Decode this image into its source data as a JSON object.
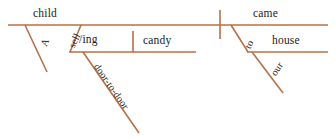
{
  "diagram": {
    "type": "reed-kellogg-sentence-diagram",
    "sentence": "A child selling candy door-to-door came to our house.",
    "line_color": "#b5714a",
    "text_color": "#1b1b1f",
    "background_color": "#ffffff",
    "width": 335,
    "height": 138,
    "words": {
      "subject": "child",
      "subject_article": "A",
      "gerund_stem": "sell",
      "gerund_suffix": "/ing",
      "gerund_object": "candy",
      "gerund_modifier": "door-to-door",
      "verb": "came",
      "preposition": "to",
      "prep_object": "house",
      "prep_object_modifier": "our"
    },
    "lines": [
      {
        "name": "main-baseline",
        "x1": 8,
        "y1": 25,
        "x2": 328,
        "y2": 25
      },
      {
        "name": "subject-predicate-bar",
        "x1": 220,
        "y1": 10,
        "x2": 220,
        "y2": 39
      },
      {
        "name": "article-a-slant",
        "x1": 25,
        "y1": 25,
        "x2": 47,
        "y2": 72
      },
      {
        "name": "gerund-stem-slant",
        "x1": 81,
        "y1": 25,
        "x2": 70,
        "y2": 52
      },
      {
        "name": "gerund-baseline",
        "x1": 70,
        "y1": 52,
        "x2": 196,
        "y2": 52
      },
      {
        "name": "gerund-object-divider",
        "x1": 133,
        "y1": 31,
        "x2": 133,
        "y2": 52
      },
      {
        "name": "door-to-door-slant",
        "x1": 83,
        "y1": 52,
        "x2": 139,
        "y2": 133
      },
      {
        "name": "preposition-to-slant",
        "x1": 231,
        "y1": 25,
        "x2": 248,
        "y2": 52
      },
      {
        "name": "prep-object-baseline",
        "x1": 248,
        "y1": 52,
        "x2": 328,
        "y2": 52
      },
      {
        "name": "our-slant",
        "x1": 252,
        "y1": 52,
        "x2": 283,
        "y2": 93
      }
    ]
  }
}
